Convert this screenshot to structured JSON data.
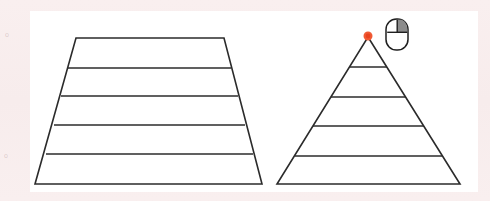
{
  "page": {
    "width": 490,
    "height": 201,
    "background_color": "#f8eeee",
    "canvas_color": "#ffffff",
    "stroke_color": "#2b2b2b"
  },
  "margin_marks": {
    "top_mark": "o",
    "bottom_mark": "o"
  },
  "figures": [
    {
      "name": "trapezoid",
      "label": "Layered trapezoid",
      "shape": "trapezoid",
      "bands": 5,
      "divider_count": 4,
      "outline_points": "76,38 224,38 262,184 35,184",
      "dividers": [
        "68,68 231,68",
        "61,96 238,96",
        "54,125 245,125",
        "46,154 253,154"
      ]
    },
    {
      "name": "triangle",
      "label": "Layered pyramid triangle",
      "shape": "triangle",
      "bands": 5,
      "divider_count": 4,
      "outline_points": "368,37 460,184 277,184",
      "dividers": [
        "350,67 387,67",
        "331,97 406,97",
        "313,126 424,126",
        "295,156 442,156"
      ]
    }
  ],
  "annotations": {
    "cursor_point": {
      "name": "apex-marker",
      "label": "Red apex point",
      "color": "#f05a34",
      "x": 368,
      "y": 36,
      "radius": 4.5
    },
    "mouse_icon": {
      "name": "mouse-icon",
      "label": "Mouse with right button highlighted",
      "highlighted_button": "right",
      "x": 386,
      "y": 19,
      "width": 22,
      "height": 31,
      "shade_color": "#8c8c8c",
      "body_color": "#ffffff",
      "outline_color": "#1f1f1f"
    }
  }
}
